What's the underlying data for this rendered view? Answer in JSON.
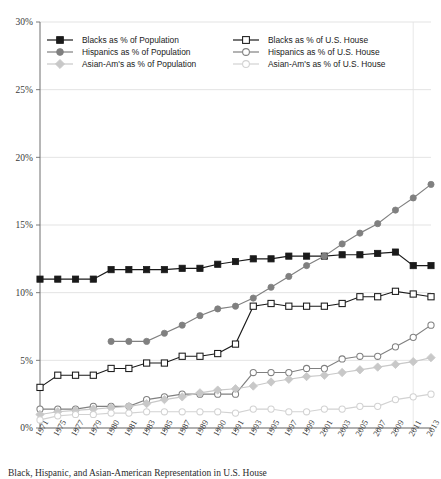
{
  "chart_data": {
    "type": "line",
    "title": "",
    "xlabel": "",
    "ylabel": "",
    "ylim": [
      0,
      30
    ],
    "ytick_labels": [
      "0%",
      "5%",
      "10%",
      "15%",
      "20%",
      "25%",
      "30%"
    ],
    "ytick_values": [
      0,
      5,
      10,
      15,
      20,
      25,
      30
    ],
    "grid": true,
    "legend_position": "top-inside",
    "categories": [
      "1971",
      "1975",
      "1977",
      "1979",
      "1980",
      "1981",
      "1983",
      "1985",
      "1987",
      "1989",
      "1990",
      "1991",
      "1993",
      "1995",
      "1997",
      "1999",
      "2001",
      "2003",
      "2005",
      "2007",
      "2009",
      "2011",
      "2013"
    ],
    "series": [
      {
        "name": "Blacks as % of Population",
        "color": "#1a1a1a",
        "marker": "filled-square",
        "values": [
          11.0,
          11.0,
          11.0,
          11.0,
          11.7,
          11.7,
          11.7,
          11.7,
          11.8,
          11.8,
          12.1,
          12.3,
          12.5,
          12.5,
          12.7,
          12.7,
          12.7,
          12.8,
          12.8,
          12.9,
          13.0,
          12.0,
          12.0
        ]
      },
      {
        "name": "Blacks as % of U.S. House",
        "color": "#1a1a1a",
        "marker": "open-square",
        "values": [
          3.0,
          3.9,
          3.9,
          3.9,
          4.4,
          4.4,
          4.8,
          4.8,
          5.3,
          5.3,
          5.5,
          6.2,
          9.0,
          9.2,
          9.0,
          9.0,
          9.0,
          9.2,
          9.7,
          9.7,
          10.1,
          9.9,
          9.7
        ]
      },
      {
        "name": "Hispanics as % of Population",
        "color": "#808080",
        "marker": "filled-circle",
        "values": [
          null,
          null,
          null,
          null,
          6.4,
          6.4,
          6.4,
          7.0,
          7.6,
          8.3,
          8.8,
          9.0,
          9.6,
          10.4,
          11.2,
          12.0,
          12.7,
          13.6,
          14.4,
          15.1,
          16.1,
          17.0,
          18.0
        ]
      },
      {
        "name": "Hispanics as % of U.S. House",
        "color": "#808080",
        "marker": "open-circle",
        "values": [
          1.4,
          1.4,
          1.4,
          1.6,
          1.6,
          1.6,
          2.1,
          2.3,
          2.5,
          2.5,
          2.5,
          2.5,
          4.1,
          4.1,
          4.1,
          4.4,
          4.4,
          5.1,
          5.3,
          5.3,
          6.0,
          6.7,
          7.6
        ]
      },
      {
        "name": "Asian-Am's as % of Population",
        "color": "#c8c8c8",
        "marker": "filled-diamond",
        "values": [
          1.0,
          1.2,
          1.3,
          1.4,
          1.5,
          1.6,
          1.8,
          2.1,
          2.3,
          2.6,
          2.8,
          2.9,
          3.1,
          3.4,
          3.6,
          3.8,
          3.9,
          4.1,
          4.3,
          4.5,
          4.7,
          4.9,
          5.2
        ]
      },
      {
        "name": "Asian-Am's as % of U.S. House",
        "color": "#d2d2d2",
        "marker": "open-circle",
        "values": [
          0.6,
          0.9,
          1.0,
          1.0,
          1.1,
          1.1,
          1.2,
          1.2,
          1.2,
          1.2,
          1.2,
          1.1,
          1.4,
          1.4,
          1.2,
          1.2,
          1.4,
          1.4,
          1.6,
          1.6,
          2.1,
          2.3,
          2.5
        ]
      }
    ],
    "legend": [
      {
        "label": "Blacks as % of Population",
        "color": "#1a1a1a",
        "marker": "filled-square",
        "col": 0
      },
      {
        "label": "Hispanics as % of Population",
        "color": "#808080",
        "marker": "filled-circle",
        "col": 0
      },
      {
        "label": "Asian-Am's as % of Population",
        "color": "#c8c8c8",
        "marker": "filled-diamond",
        "col": 0
      },
      {
        "label": "Blacks as % of U.S. House",
        "color": "#1a1a1a",
        "marker": "open-square",
        "col": 1
      },
      {
        "label": "Hispanics as % of U.S. House",
        "color": "#808080",
        "marker": "open-circle",
        "col": 1
      },
      {
        "label": "Asian-Am's as % of U.S. House",
        "color": "#d2d2d2",
        "marker": "open-circle",
        "col": 1
      }
    ]
  },
  "caption": {
    "text": "Black, Hispanic, and Asian-American Representation in U.S. House"
  },
  "colors": {
    "black_series": "#1a1a1a",
    "hispanic_series": "#808080",
    "asian_series": "#c8c8c8",
    "gridline": "#dcdcdc",
    "axis": "#6e6e6e"
  }
}
